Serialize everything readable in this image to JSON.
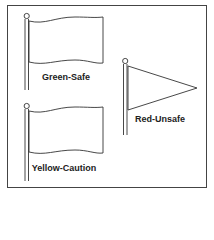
{
  "diagram": {
    "flags": [
      {
        "id": "green",
        "shape": "rectangular-flag",
        "label": "Green-Safe"
      },
      {
        "id": "yellow",
        "shape": "rectangular-flag",
        "label": "Yellow-Caution"
      },
      {
        "id": "red",
        "shape": "triangular-pennant",
        "label": "Red-Unsafe"
      }
    ],
    "stroke_color": "#333333"
  }
}
